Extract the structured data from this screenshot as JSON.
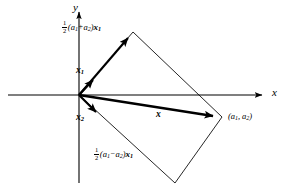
{
  "figure": {
    "background_color": "#ffffff",
    "ink_color": "#000000",
    "width": 291,
    "height": 190
  },
  "axes": {
    "x_label": "x",
    "y_label": "y",
    "origin": {
      "x": 79,
      "y": 95
    },
    "x_axis": {
      "x1": 8,
      "y1": 95,
      "x2": 266,
      "y2": 95
    },
    "y_axis": {
      "x1": 79,
      "y1": 183,
      "x2": 79,
      "y2": 8
    }
  },
  "labels": {
    "upper_expression": {
      "numerator": "1",
      "denominator": "2",
      "open_paren": "(",
      "term_a": "a",
      "term_a_sub": "1",
      "operator": "+",
      "term_b": "a",
      "term_b_sub": "2",
      "close_paren": ")",
      "vector": "x",
      "vector_sub": "1"
    },
    "lower_expression": {
      "numerator": "1",
      "denominator": "2",
      "open_paren": "(",
      "term_a": "a",
      "term_a_sub": "1",
      "operator": "−",
      "term_b": "a",
      "term_b_sub": "2",
      "close_paren": ")",
      "vector": "x",
      "vector_sub": "1"
    },
    "vector_x1": {
      "symbol": "x",
      "subscript": "1"
    },
    "vector_x2": {
      "symbol": "x",
      "subscript": "2"
    },
    "vector_x": {
      "symbol": "x"
    },
    "point_coords": {
      "open_paren": "(",
      "first": "a",
      "first_sub": "1",
      "comma": ",",
      "second": "a",
      "second_sub": "2",
      "close_paren": ")"
    }
  },
  "geometry": {
    "parallelogram_vertices": [
      {
        "x": 79,
        "y": 95
      },
      {
        "x": 133,
        "y": 32
      },
      {
        "x": 222,
        "y": 117
      },
      {
        "x": 175,
        "y": 183
      }
    ],
    "vectors": [
      {
        "name": "x1",
        "from": {
          "x": 79,
          "y": 95
        },
        "to": {
          "x": 99,
          "y": 73
        },
        "bold": true
      },
      {
        "name": "x2",
        "from": {
          "x": 79,
          "y": 95
        },
        "to": {
          "x": 103,
          "y": 119
        },
        "bold": true
      },
      {
        "name": "x",
        "from": {
          "x": 79,
          "y": 95
        },
        "to": {
          "x": 220,
          "y": 117
        },
        "bold": true
      },
      {
        "name": "half-sum-x1",
        "from": {
          "x": 79,
          "y": 95
        },
        "to": {
          "x": 133,
          "y": 33
        },
        "bold": true
      }
    ]
  }
}
